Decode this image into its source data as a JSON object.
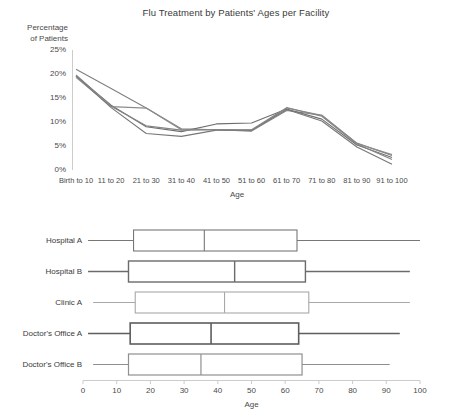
{
  "line_chart": {
    "title": "Flu Treatment by Patients' Ages per Facility",
    "ylabel_line1": "Percentage",
    "ylabel_line2": "of Patients",
    "xlabel": "Age",
    "yticks": [
      "25%",
      "20%",
      "15%",
      "10%",
      "5%",
      "0%"
    ],
    "xticks": [
      "Birth to 10",
      "11 to 20",
      "21 to 30",
      "31 to 40",
      "41 to 50",
      "51 to 60",
      "61 to 70",
      "71 to 80",
      "81 to 90",
      "91 to 100"
    ]
  },
  "box_chart": {
    "xlabel": "Age",
    "xticks": [
      "0",
      "10",
      "20",
      "30",
      "40",
      "50",
      "60",
      "70",
      "80",
      "90",
      "100"
    ],
    "rows": [
      {
        "label": "Hospital A"
      },
      {
        "label": "Hospital B"
      },
      {
        "label": "Clinic A"
      },
      {
        "label": "Doctor's Office A"
      },
      {
        "label": "Doctor's Office B"
      }
    ]
  },
  "chart_data": [
    {
      "type": "line",
      "title": "Flu Treatment by Patients' Ages per Facility",
      "xlabel": "Age",
      "ylabel": "Percentage of Patients",
      "categories": [
        "Birth to 10",
        "11 to 20",
        "21 to 30",
        "31 to 40",
        "41 to 50",
        "51 to 60",
        "61 to 70",
        "71 to 80",
        "81 to 90",
        "91 to 100"
      ],
      "ylim": [
        0,
        25
      ],
      "ytick_values": [
        0,
        5,
        10,
        15,
        20,
        25
      ],
      "ytick_labels": [
        "0%",
        "5%",
        "10%",
        "15%",
        "20%",
        "25%"
      ],
      "grid": false,
      "legend": "none",
      "series": [
        {
          "name": "Hospital A",
          "color": "#808080",
          "values": [
            21.0,
            17.0,
            12.9,
            8.6,
            8.4,
            8.1,
            12.4,
            11.4,
            5.6,
            3.0
          ]
        },
        {
          "name": "Hospital B",
          "color": "#6e6e6e",
          "values": [
            19.6,
            13.5,
            9.0,
            8.0,
            9.6,
            9.8,
            12.7,
            10.6,
            5.2,
            2.6
          ]
        },
        {
          "name": "Clinic A",
          "color": "#8c8c8c",
          "values": [
            19.3,
            13.2,
            12.9,
            8.4,
            8.4,
            8.2,
            12.9,
            11.4,
            5.5,
            3.2
          ]
        },
        {
          "name": "Doctor's Office A",
          "color": "#777777",
          "values": [
            19.6,
            13.0,
            7.6,
            7.0,
            8.3,
            8.3,
            12.6,
            10.2,
            4.8,
            1.2
          ]
        },
        {
          "name": "Doctor's Office B",
          "color": "#858585",
          "values": [
            19.8,
            13.3,
            9.2,
            8.3,
            8.4,
            8.4,
            13.0,
            11.2,
            5.4,
            2.2
          ]
        }
      ]
    },
    {
      "type": "box",
      "orientation": "horizontal",
      "xlabel": "Age",
      "xlim": [
        0,
        100
      ],
      "xtick_values": [
        0,
        10,
        20,
        30,
        40,
        50,
        60,
        70,
        80,
        90,
        100
      ],
      "grid": false,
      "legend": "none",
      "boxes": [
        {
          "label": "Hospital A",
          "whisker_low": 1.5,
          "q1": 15.0,
          "median": 36.0,
          "q3": 63.5,
          "whisker_high": 100.0,
          "stroke": "#777777",
          "stroke_width": 1.1
        },
        {
          "label": "Hospital B",
          "whisker_low": 1.5,
          "q1": 13.5,
          "median": 45.0,
          "q3": 66.0,
          "whisker_high": 97.0,
          "stroke": "#6b6b6b",
          "stroke_width": 1.4
        },
        {
          "label": "Clinic A",
          "whisker_low": 3.0,
          "q1": 15.5,
          "median": 42.0,
          "q3": 67.0,
          "whisker_high": 97.0,
          "stroke": "#a8a8a8",
          "stroke_width": 1.1
        },
        {
          "label": "Doctor's Office A",
          "whisker_low": 1.5,
          "q1": 14.0,
          "median": 38.0,
          "q3": 64.0,
          "whisker_high": 94.0,
          "stroke": "#5e5e5e",
          "stroke_width": 1.6
        },
        {
          "label": "Doctor's Office B",
          "whisker_low": 3.0,
          "q1": 13.5,
          "median": 35.0,
          "q3": 65.0,
          "whisker_high": 91.0,
          "stroke": "#8f8f8f",
          "stroke_width": 1.2
        }
      ]
    }
  ]
}
